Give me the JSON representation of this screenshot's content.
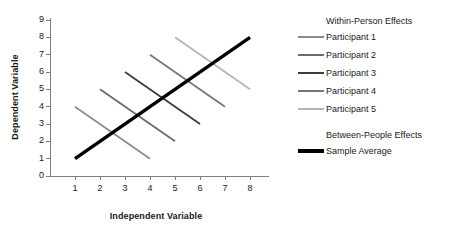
{
  "chart_data": {
    "type": "line",
    "title": "",
    "xlabel": "Independent Variable",
    "ylabel": "Dependent Variable",
    "xlim": [
      0,
      8.6
    ],
    "ylim": [
      0,
      9
    ],
    "xticks": [
      1,
      2,
      3,
      4,
      5,
      6,
      7,
      8
    ],
    "yticks": [
      0,
      1,
      2,
      3,
      4,
      5,
      6,
      7,
      8,
      9
    ],
    "grid": false,
    "legend_position": "right",
    "legend_groups": [
      {
        "header": "Within-Person Effects",
        "entries": [
          "Participant 1",
          "Participant 2",
          "Participant 3",
          "Participant 4",
          "Participant 5"
        ]
      },
      {
        "header": "Between-People Effects",
        "entries": [
          "Sample Average"
        ]
      }
    ],
    "series": [
      {
        "name": "Participant 1",
        "x": [
          1,
          4
        ],
        "y": [
          4,
          1
        ],
        "color": "#8c8c8c",
        "width": 1.8
      },
      {
        "name": "Participant 2",
        "x": [
          2,
          5
        ],
        "y": [
          5,
          2
        ],
        "color": "#6b6b6b",
        "width": 1.8
      },
      {
        "name": "Participant 3",
        "x": [
          3,
          6
        ],
        "y": [
          6,
          3
        ],
        "color": "#3d3d3d",
        "width": 1.8
      },
      {
        "name": "Participant 4",
        "x": [
          4,
          7
        ],
        "y": [
          7,
          4
        ],
        "color": "#777777",
        "width": 1.8
      },
      {
        "name": "Participant 5",
        "x": [
          5,
          8
        ],
        "y": [
          8,
          5
        ],
        "color": "#b5b5b5",
        "width": 1.8
      },
      {
        "name": "Sample Average",
        "x": [
          1,
          8
        ],
        "y": [
          1,
          8
        ],
        "color": "#000000",
        "width": 3.4
      }
    ]
  },
  "axis": {
    "line_color": "#808080",
    "tick_color": "#808080"
  }
}
